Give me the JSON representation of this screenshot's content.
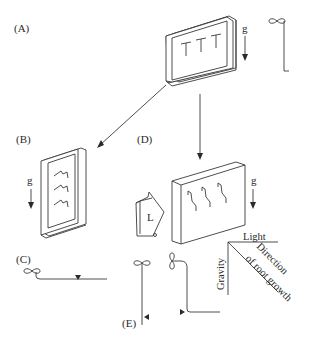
{
  "panels": {
    "A": {
      "label": "(A)",
      "gravity_label": "g"
    },
    "B": {
      "label": "(B)",
      "gravity_label": "g"
    },
    "C": {
      "label": "(C)"
    },
    "D": {
      "label": "(D)",
      "gravity_label": "g",
      "light_box_label": "L"
    },
    "E": {
      "label": "(E)"
    }
  },
  "vector_diagram": {
    "light_label": "Light",
    "gravity_label": "Gravity",
    "direction_label_line1": "Direction",
    "direction_label_line2": "of root growth"
  }
}
